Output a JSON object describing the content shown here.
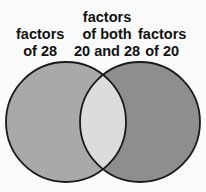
{
  "diagram": {
    "type": "venn",
    "sets": [
      {
        "name": "left",
        "label_lines": [
          "factors",
          "of 28"
        ],
        "fill": "#a9a9a9"
      },
      {
        "name": "right",
        "label_lines": [
          "factors",
          "of 20"
        ],
        "fill": "#8e8e8e"
      }
    ],
    "intersection": {
      "label_lines": [
        "factors",
        "of both",
        "20 and 28"
      ],
      "fill": "#dcdcdc"
    },
    "stroke": "#1a1a1a"
  }
}
